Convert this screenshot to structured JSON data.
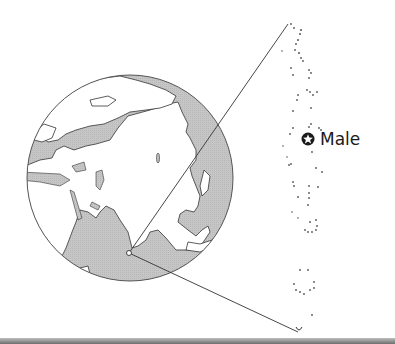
{
  "map": {
    "type": "locator-map",
    "globe": {
      "center": [
        130,
        178
      ],
      "radius": 103,
      "ocean_color": "#c4c4c4",
      "land_color": "#ffffff",
      "outline_color": "#555555",
      "visible_regions": [
        "Europe",
        "Asia",
        "Arabian Peninsula",
        "Indian subcontinent",
        "Indian Ocean",
        "Arctic Ocean",
        "Pacific Ocean"
      ]
    },
    "locator_marker": {
      "position": [
        129,
        253
      ],
      "label": ""
    },
    "inset": {
      "subject": "Maldives atoll chain",
      "dot_color": "#555555"
    },
    "capital": {
      "name": "Male",
      "symbol": "star-in-circle",
      "position": [
        308,
        139
      ]
    },
    "colors": {
      "line": "#333333",
      "text": "#1a1a1a",
      "strip": "#7a7a7a"
    }
  }
}
